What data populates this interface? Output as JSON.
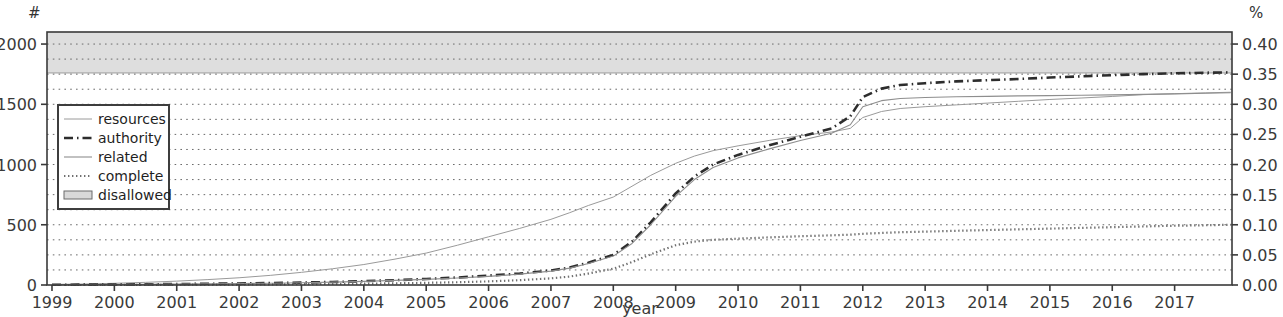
{
  "figure": {
    "background": "#ffffff",
    "plot_area": {
      "left": 47,
      "top": 32,
      "right": 1232,
      "bottom": 285
    }
  },
  "axes": {
    "left_unit": "#",
    "right_unit": "%",
    "xlabel": "year",
    "left_ticks": [
      "0",
      "500",
      "1000",
      "1500",
      "2000"
    ],
    "left_tick_values": [
      0,
      500,
      1000,
      1500,
      2000
    ],
    "right_ticks": [
      "0.00",
      "0.05",
      "0.10",
      "0.15",
      "0.20",
      "0.25",
      "0.30",
      "0.35",
      "0.40"
    ],
    "right_tick_values": [
      0.0,
      0.05,
      0.1,
      0.15,
      0.2,
      0.25,
      0.3,
      0.35,
      0.4
    ],
    "x_ticks": [
      "1999",
      "2000",
      "2001",
      "2002",
      "2003",
      "2004",
      "2005",
      "2006",
      "2007",
      "2008",
      "2009",
      "2010",
      "2011",
      "2012",
      "2013",
      "2014",
      "2015",
      "2016",
      "2017"
    ],
    "x_tick_values": [
      1999,
      2000,
      2001,
      2002,
      2003,
      2004,
      2005,
      2006,
      2007,
      2008,
      2009,
      2010,
      2011,
      2012,
      2013,
      2014,
      2015,
      2016,
      2017
    ]
  },
  "legend": {
    "position": "upper-left-inset",
    "items": [
      {
        "label": "resources",
        "style": "thin-solid-gray",
        "color": "#9a9a9a"
      },
      {
        "label": "authority",
        "style": "dash-dot",
        "color": "#2d2d2d"
      },
      {
        "label": "related",
        "style": "solid",
        "color": "#8e8e8e"
      },
      {
        "label": "complete",
        "style": "dotted",
        "color": "#6f6f6f"
      },
      {
        "label": "disallowed",
        "style": "filled-band",
        "color": "#d8d8d8"
      }
    ]
  },
  "chart_data": {
    "type": "line",
    "title": "",
    "xlabel": "year",
    "ylabel": "#",
    "y2label": "%",
    "xlim": [
      1998.92,
      1017.92
    ],
    "x_range": [
      1998.92,
      2017.92
    ],
    "ylim": [
      0,
      2100
    ],
    "y2lim": [
      0.0,
      0.42
    ],
    "grid": true,
    "grid_style": "dotted-horizontal",
    "y_axis_mapping": "left '#' count axis and right '%' axis are two scales of the same curves; 2000 # == 0.40 %",
    "x": [
      1999.0,
      1999.5,
      2000.0,
      2000.5,
      2001.0,
      2001.5,
      2002.0,
      2002.5,
      2003.0,
      2003.5,
      2004.0,
      2004.5,
      2005.0,
      2005.5,
      2006.0,
      2006.5,
      2007.0,
      2007.3,
      2007.6,
      2008.0,
      2008.3,
      2008.6,
      2009.0,
      2009.3,
      2009.6,
      2010.0,
      2010.5,
      2011.0,
      2011.5,
      2011.8,
      2012.0,
      2012.3,
      2012.6,
      2013.0,
      2013.5,
      2014.0,
      2014.5,
      2015.0,
      2015.5,
      2016.0,
      2016.5,
      2017.0,
      2017.5,
      2017.9
    ],
    "series": [
      {
        "name": "resources",
        "style": "thin-solid-gray",
        "color": "#9a9a9a",
        "values": [
          5,
          8,
          14,
          22,
          32,
          45,
          60,
          80,
          105,
          135,
          170,
          215,
          265,
          330,
          400,
          470,
          545,
          600,
          660,
          730,
          820,
          910,
          1010,
          1070,
          1115,
          1155,
          1200,
          1240,
          1270,
          1300,
          1390,
          1440,
          1465,
          1480,
          1495,
          1510,
          1525,
          1540,
          1552,
          1565,
          1580,
          1588,
          1595,
          1600
        ]
      },
      {
        "name": "authority",
        "style": "dash-dot",
        "color": "#2d2d2d",
        "values": [
          2,
          3,
          4,
          6,
          8,
          10,
          13,
          16,
          20,
          25,
          32,
          40,
          50,
          62,
          78,
          95,
          120,
          145,
          185,
          250,
          360,
          520,
          760,
          900,
          1000,
          1080,
          1160,
          1230,
          1300,
          1400,
          1560,
          1630,
          1660,
          1675,
          1690,
          1700,
          1710,
          1722,
          1732,
          1742,
          1750,
          1757,
          1762,
          1765
        ]
      },
      {
        "name": "related",
        "style": "solid",
        "color": "#8e8e8e",
        "values": [
          2,
          3,
          4,
          5,
          7,
          9,
          12,
          15,
          19,
          24,
          30,
          38,
          47,
          58,
          72,
          90,
          115,
          140,
          178,
          240,
          345,
          500,
          735,
          875,
          975,
          1055,
          1130,
          1200,
          1260,
          1330,
          1480,
          1530,
          1548,
          1556,
          1562,
          1566,
          1570,
          1572,
          1575,
          1578,
          1582,
          1586,
          1592,
          1596
        ]
      },
      {
        "name": "complete",
        "style": "dotted",
        "color": "#6f6f6f",
        "values": [
          0,
          0,
          1,
          1,
          2,
          3,
          4,
          5,
          7,
          9,
          11,
          14,
          18,
          23,
          30,
          40,
          55,
          70,
          95,
          135,
          190,
          255,
          330,
          360,
          375,
          385,
          395,
          405,
          412,
          418,
          425,
          432,
          438,
          443,
          450,
          456,
          462,
          468,
          474,
          480,
          486,
          492,
          496,
          500
        ]
      }
    ],
    "bands": [
      {
        "name": "disallowed",
        "style": "filled-band",
        "fill": "#d8d8d8",
        "y_top": 2100,
        "y_bottom": 1760,
        "note": "light gray shaded region across the full width at the top of the plot"
      }
    ]
  }
}
